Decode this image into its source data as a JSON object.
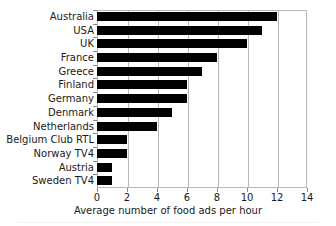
{
  "chart_data": {
    "type": "bar",
    "orientation": "horizontal",
    "title": "",
    "xlabel": "Average number of food ads per hour",
    "ylabel": "",
    "xlim": [
      0,
      14
    ],
    "xticks": [
      0,
      2,
      4,
      6,
      8,
      10,
      12,
      14
    ],
    "grid": true,
    "grid_axis": "x",
    "legend": false,
    "bar_color": "#000000",
    "categories": [
      "Australia",
      "USA",
      "UK",
      "France",
      "Greece",
      "Finland",
      "Germany",
      "Denmark",
      "Netherlands",
      "Belgium Club RTL",
      "Norway TV4",
      "Austria",
      "Sweden TV4"
    ],
    "values": [
      12,
      11,
      10,
      8,
      7,
      6,
      6,
      5,
      4,
      2,
      2,
      1,
      1
    ]
  }
}
